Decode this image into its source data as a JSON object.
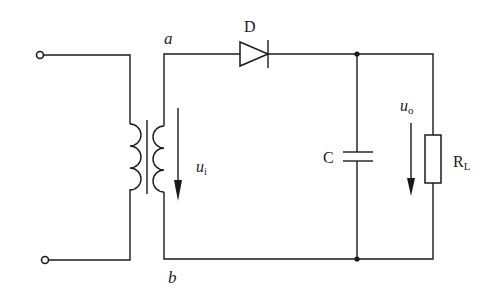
{
  "diagram": {
    "type": "half-wave rectifier with capacitor filter",
    "labels": {
      "node_top": "a",
      "node_bottom": "b",
      "diode": "D",
      "capacitor": "C",
      "load_resistor_main": "R",
      "load_resistor_sub": "L",
      "input_voltage_main": "u",
      "input_voltage_sub": "i",
      "output_voltage_main": "u",
      "output_voltage_sub": "o"
    },
    "components": [
      {
        "id": "transformer",
        "kind": "transformer"
      },
      {
        "id": "D",
        "kind": "diode"
      },
      {
        "id": "C",
        "kind": "capacitor"
      },
      {
        "id": "RL",
        "kind": "resistor"
      }
    ],
    "colors": {
      "ink": "#1a1a1a",
      "background": "#ffffff"
    }
  }
}
